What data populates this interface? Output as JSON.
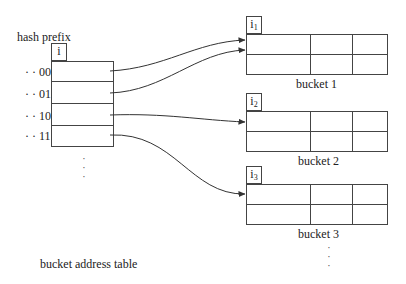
{
  "table": {
    "title": "hash prefix",
    "depth_label": "i",
    "caption": "bucket address table",
    "rows": [
      {
        "prefix": "· · 00",
        "target_bucket": 1
      },
      {
        "prefix": "· · 01",
        "target_bucket": 1
      },
      {
        "prefix": "· · 10",
        "target_bucket": 2
      },
      {
        "prefix": "· · 11",
        "target_bucket": 3
      }
    ],
    "continuation": "⋮"
  },
  "buckets": [
    {
      "depth_base": "i",
      "depth_sub": "1",
      "caption": "bucket 1"
    },
    {
      "depth_base": "i",
      "depth_sub": "2",
      "caption": "bucket 2"
    },
    {
      "depth_base": "i",
      "depth_sub": "3",
      "caption": "bucket 3"
    }
  ],
  "buckets_continuation": "⋮",
  "colors": {
    "line": "#444444",
    "text": "#222222",
    "background": "#ffffff"
  }
}
